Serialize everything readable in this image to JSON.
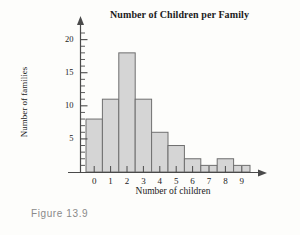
{
  "caption": "Figure 13.9",
  "chart_data": {
    "type": "bar",
    "title": "Number of Children per Family",
    "xlabel": "Number of children",
    "ylabel": "Number of families",
    "categories": [
      "0",
      "1",
      "2",
      "3",
      "4",
      "5",
      "6",
      "7",
      "8",
      "9"
    ],
    "values": [
      8,
      11,
      18,
      11,
      6,
      4,
      2,
      1,
      2,
      1
    ],
    "ylim": [
      0,
      21
    ],
    "xlim": [
      -0.9,
      10.4
    ],
    "y_major_ticks": [
      5,
      10,
      15,
      20
    ],
    "y_minor_tick_step": 1,
    "grid": false,
    "legend": null,
    "bar_fill_color": "#d5d5d5",
    "bar_border_color": "#6f6f6f",
    "axis_color": "#4a4a4a",
    "background_color": "#fdfdfb",
    "axis_style": "arrow-headed L axes, bars adjacent (histogram)",
    "series": [
      {
        "name": "Number of families",
        "values": [
          8,
          11,
          18,
          11,
          6,
          4,
          2,
          1,
          2,
          1
        ]
      }
    ]
  }
}
